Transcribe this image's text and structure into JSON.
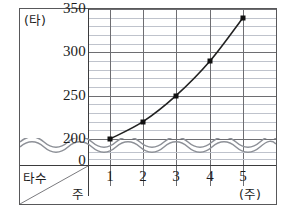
{
  "chart_data": {
    "type": "line",
    "title": "",
    "xlabel": "주",
    "ylabel": "타",
    "x_unit_label": "(주)",
    "y_unit_label": "(타)",
    "corner_row_label": "타수",
    "corner_col_label": "주",
    "x": [
      1,
      2,
      3,
      4,
      5
    ],
    "values": [
      200,
      220,
      250,
      290,
      340
    ],
    "series": [
      {
        "name": "타수",
        "values": [
          200,
          220,
          250,
          290,
          340
        ]
      }
    ],
    "xticks": [
      "1",
      "2",
      "3",
      "4",
      "5"
    ],
    "yticks": [
      "0",
      "200",
      "250",
      "300",
      "350"
    ],
    "ylim": [
      200,
      350
    ],
    "y_major_step": 50,
    "y_minor_step": 10,
    "axis_break": true,
    "axis_break_style": "wavy",
    "grid": true,
    "legend": "none",
    "marker": "square",
    "line_color": "#222222",
    "marker_color": "#111111",
    "major_grid_color": "#6e6e72",
    "minor_grid_color": "#bfc3cc"
  },
  "axes": {
    "y_tick_labels": [
      {
        "text": "350",
        "value": 350
      },
      {
        "text": "300",
        "value": 300
      },
      {
        "text": "250",
        "value": 250
      },
      {
        "text": "200",
        "value": 200
      },
      {
        "text": "0",
        "value": 0
      }
    ],
    "x_tick_labels": [
      {
        "text": "1",
        "value": 1
      },
      {
        "text": "2",
        "value": 2
      },
      {
        "text": "3",
        "value": 3
      },
      {
        "text": "4",
        "value": 4
      },
      {
        "text": "5",
        "value": 5
      }
    ]
  }
}
